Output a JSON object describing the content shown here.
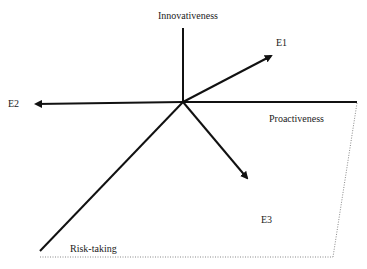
{
  "diagram": {
    "axes": {
      "innovativeness": "Innovativeness",
      "proactiveness": "Proactiveness",
      "risk_taking": "Risk-taking"
    },
    "vectors": {
      "e1": "E1",
      "e2": "E2",
      "e3": "E3"
    },
    "colors": {
      "line": "#111111",
      "dotted": "#888888"
    }
  }
}
